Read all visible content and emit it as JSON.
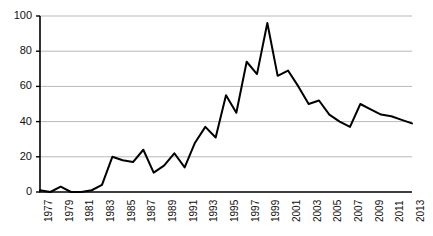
{
  "chart_data": {
    "type": "line",
    "title": "",
    "subtitle": "",
    "xlabel": "",
    "ylabel": "",
    "xlim": [
      1977,
      2013
    ],
    "ylim": [
      0,
      100
    ],
    "grid": true,
    "grid_axis": "y",
    "legend": "none",
    "series_color": "#000000",
    "line_width": 2,
    "x": [
      1977,
      1978,
      1979,
      1980,
      1981,
      1982,
      1983,
      1984,
      1985,
      1986,
      1987,
      1988,
      1989,
      1990,
      1991,
      1992,
      1993,
      1994,
      1995,
      1996,
      1997,
      1998,
      1999,
      2000,
      2001,
      2002,
      2003,
      2004,
      2005,
      2006,
      2007,
      2008,
      2009,
      2010,
      2011,
      2012,
      2013
    ],
    "series": [
      {
        "name": "value",
        "values": [
          1,
          0,
          3,
          0,
          0,
          1,
          4,
          20,
          18,
          17,
          24,
          11,
          15,
          22,
          14,
          28,
          37,
          31,
          55,
          45,
          74,
          67,
          96,
          66,
          69,
          60,
          50,
          52,
          44,
          40,
          37,
          50,
          47,
          44,
          43,
          41,
          39
        ]
      }
    ],
    "y_ticks": [
      0,
      20,
      40,
      60,
      80,
      100
    ],
    "y_tick_labels": [
      "0",
      "20",
      "40",
      "60",
      "80",
      "100"
    ],
    "x_ticks": [
      1977,
      1979,
      1981,
      1983,
      1985,
      1987,
      1989,
      1991,
      1993,
      1995,
      1997,
      1999,
      2001,
      2003,
      2005,
      2007,
      2009,
      2011,
      2013
    ],
    "x_tick_labels": [
      "1977",
      "1979",
      "1981",
      "1983",
      "1985",
      "1987",
      "1989",
      "1991",
      "1993",
      "1995",
      "1997",
      "1999",
      "2001",
      "2003",
      "2005",
      "2007",
      "2009",
      "2011",
      "2013"
    ],
    "annotations": [],
    "colors": {
      "line": "#000000",
      "axis": "#000000",
      "grid": "#b9b9b9",
      "text": "#111111",
      "background": "#ffffff"
    }
  }
}
